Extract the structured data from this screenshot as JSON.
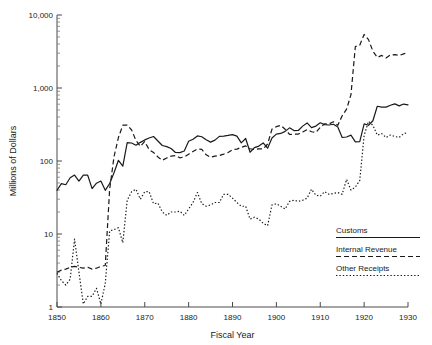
{
  "chart_data": {
    "type": "line",
    "title": "",
    "xlabel": "Fiscal Year",
    "ylabel": "Millions of Dollars",
    "xlim": [
      1850,
      1930
    ],
    "ylim": [
      1,
      10000
    ],
    "yscale": "log",
    "grid": false,
    "legend_position": "lower-right",
    "xticks": [
      "1850",
      "1860",
      "1870",
      "1880",
      "1890",
      "1900",
      "1910",
      "1920",
      "1930"
    ],
    "xtick_values": [
      1850,
      1860,
      1870,
      1880,
      1890,
      1900,
      1910,
      1920,
      1930
    ],
    "yticks": [
      "1",
      "10",
      "100",
      "1,000",
      "10,000"
    ],
    "ytick_values": [
      1,
      10,
      100,
      1000,
      10000
    ],
    "x": [
      1850,
      1851,
      1852,
      1853,
      1854,
      1855,
      1856,
      1857,
      1858,
      1859,
      1860,
      1861,
      1862,
      1863,
      1864,
      1865,
      1866,
      1867,
      1868,
      1869,
      1870,
      1871,
      1872,
      1873,
      1874,
      1875,
      1876,
      1877,
      1878,
      1879,
      1880,
      1881,
      1882,
      1883,
      1884,
      1885,
      1886,
      1887,
      1888,
      1889,
      1890,
      1891,
      1892,
      1893,
      1894,
      1895,
      1896,
      1897,
      1898,
      1899,
      1900,
      1901,
      1902,
      1903,
      1904,
      1905,
      1906,
      1907,
      1908,
      1909,
      1910,
      1911,
      1912,
      1913,
      1914,
      1915,
      1916,
      1917,
      1918,
      1919,
      1920,
      1921,
      1922,
      1923,
      1924,
      1925,
      1926,
      1927,
      1928,
      1929,
      1930
    ],
    "series": [
      {
        "name": "Customs",
        "style": "solid",
        "values": [
          39.7,
          49.0,
          47.3,
          58.9,
          64.2,
          53.0,
          64.0,
          63.9,
          41.8,
          49.6,
          53.2,
          39.6,
          49.1,
          69.1,
          102.3,
          84.9,
          179.0,
          176.4,
          164.5,
          180.0,
          194.5,
          206.3,
          216.4,
          188.1,
          163.1,
          157.2,
          148.1,
          130.9,
          130.2,
          137.3,
          186.5,
          198.2,
          220.4,
          214.7,
          195.1,
          181.5,
          192.9,
          217.3,
          219.1,
          223.8,
          229.7,
          219.5,
          177.5,
          203.4,
          131.8,
          152.2,
          160.0,
          176.6,
          149.6,
          206.1,
          233.2,
          238.6,
          254.4,
          284.5,
          261.3,
          261.8,
          300.3,
          332.2,
          286.1,
          300.7,
          333.7,
          314.5,
          311.3,
          318.9,
          292.3,
          209.8,
          213.2,
          225.9,
          182.8,
          184.5,
          322.9,
          308.6,
          356.4,
          561.9,
          545.6,
          547.6,
          579.4,
          605.5,
          568.9,
          602.3,
          587.0
        ]
      },
      {
        "name": "Internal Revenue",
        "style": "dashed",
        "values": [
          3.0,
          3.2,
          3.3,
          3.5,
          3.6,
          3.5,
          3.4,
          3.5,
          3.3,
          3.4,
          3.6,
          3.7,
          41.0,
          115.0,
          209.5,
          309.2,
          310.9,
          266.0,
          191.1,
          158.4,
          185.2,
          143.1,
          130.6,
          113.7,
          102.4,
          110.0,
          116.7,
          118.6,
          110.6,
          113.6,
          124.0,
          135.3,
          146.5,
          144.6,
          121.6,
          112.5,
          116.8,
          118.8,
          124.3,
          130.9,
          142.6,
          145.7,
          153.9,
          161.0,
          147.1,
          143.4,
          146.8,
          146.7,
          170.9,
          273.4,
          295.3,
          307.2,
          271.9,
          230.8,
          232.9,
          234.1,
          249.2,
          269.7,
          251.7,
          246.2,
          289.9,
          322.5,
          321.6,
          344.4,
          308.7,
          415.7,
          512.7,
          809.4,
          3694.6,
          3850.2,
          5407.6,
          4595.4,
          3197.5,
          2621.7,
          2796.2,
          2584.1,
          2836.0,
          2865.7,
          2790.5,
          2939.1,
          3040.1
        ]
      },
      {
        "name": "Other Receipts",
        "style": "dotted",
        "values": [
          2.9,
          2.3,
          2.0,
          2.4,
          8.5,
          3.0,
          1.1,
          1.4,
          1.4,
          1.8,
          1.1,
          2.1,
          11.0,
          11.5,
          12.2,
          7.6,
          29.0,
          38.0,
          41.0,
          30.0,
          38.0,
          38.0,
          26.0,
          26.5,
          20.0,
          18.0,
          20.0,
          20.0,
          20.5,
          18.0,
          22.0,
          27.0,
          37.0,
          26.0,
          24.0,
          25.0,
          27.0,
          27.0,
          35.0,
          35.0,
          31.0,
          27.0,
          24.0,
          24.0,
          16.0,
          17.0,
          16.0,
          14.0,
          13.0,
          25.0,
          26.0,
          24.0,
          22.0,
          28.0,
          29.0,
          28.0,
          29.0,
          31.0,
          41.0,
          34.0,
          33.0,
          38.0,
          35.0,
          36.0,
          37.0,
          35.0,
          56.0,
          40.0,
          44.0,
          54.0,
          223.0,
          349.0,
          308.0,
          226.0,
          237.0,
          210.0,
          227.0,
          216.0,
          211.0,
          236.0,
          247.0
        ]
      }
    ]
  },
  "legend": {
    "entries": [
      {
        "label": "Customs",
        "style": "solid"
      },
      {
        "label": "Internal Revenue",
        "style": "dashed"
      },
      {
        "label": "Other Receipts",
        "style": "dotted"
      }
    ]
  }
}
